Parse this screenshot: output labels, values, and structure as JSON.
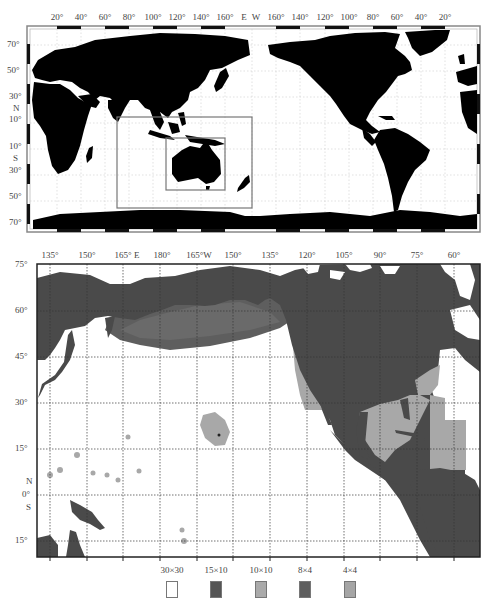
{
  "top_map": {
    "title": "World map with study region boxes",
    "top_axis_labels": [
      "20°",
      "40°",
      "60°",
      "80°",
      "100°",
      "120°",
      "140°",
      "160°",
      "E",
      "W",
      "160°",
      "140°",
      "120°",
      "100°",
      "80°",
      "60°",
      "40°",
      "20°"
    ],
    "left_axis_labels": [
      "70°",
      "50°",
      "30°",
      "N",
      "10°",
      "10°",
      "S",
      "30°",
      "50°",
      "70°"
    ],
    "boxes": [
      {
        "name": "outer-region-box",
        "description": "Indian Ocean / Maritime Continent region"
      },
      {
        "name": "inner-region-box",
        "description": "Australia region"
      }
    ],
    "colors": {
      "land": "#000000",
      "ocean": "#ffffff",
      "box": "#777777"
    }
  },
  "bottom_map": {
    "title": "North Pacific / North America nested grid domains",
    "top_axis_labels": [
      "135°",
      "150°",
      "165° E",
      "180°",
      "165°W",
      "150°",
      "135°",
      "120°",
      "105°",
      "90°",
      "75°",
      "60°"
    ],
    "left_axis_labels": [
      "75°",
      "60°",
      "45°",
      "30°",
      "15°",
      "N",
      "0°",
      "S",
      "15°"
    ],
    "colors": {
      "land": "#4a4a4a",
      "ocean": "#ffffff",
      "grid_dark": "#5a5a5a",
      "grid_light": "#a8a8a8"
    }
  },
  "legend": {
    "items": [
      {
        "label": "30×30",
        "color": "#ffffff"
      },
      {
        "label": "15×10",
        "color": "#555555"
      },
      {
        "label": "10×10",
        "color": "#aaaaaa"
      },
      {
        "label": "8×4",
        "color": "#5e5e5e"
      },
      {
        "label": "4×4",
        "color": "#a5a5a5"
      }
    ]
  }
}
